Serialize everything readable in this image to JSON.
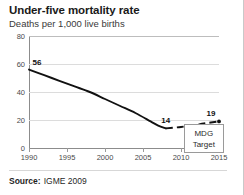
{
  "card": {
    "title": "Under-five mortality rate",
    "subtitle": "Deaths per 1,000 live births",
    "source_label": "Source:",
    "source_value": "IGME 2009"
  },
  "annotations": {
    "mdg_line1": "MDG",
    "mdg_line2": "Target"
  },
  "colors": {
    "line": "#111111",
    "grid": "#dcdcdc",
    "axis": "#8c8c8c",
    "text": "#1a1a1a",
    "card_bg": "#ffffff"
  },
  "chart_data": {
    "type": "line",
    "title": "Under-five mortality rate",
    "subtitle": "Deaths per 1,000 live births",
    "xlabel": "",
    "ylabel": "Deaths per 1,000 live births",
    "xlim": [
      1990,
      2015
    ],
    "ylim": [
      0,
      80
    ],
    "xticks": [
      1990,
      1995,
      2000,
      2005,
      2010,
      2015
    ],
    "xtick_labels": [
      "1990",
      "1995",
      "2000",
      "2005",
      "2010",
      "2015"
    ],
    "yticks": [
      0,
      20,
      40,
      60,
      80
    ],
    "ytick_labels": [
      "0",
      "20",
      "40",
      "60",
      "80"
    ],
    "grid": "horizontal",
    "legend": "none",
    "series": [
      {
        "name": "Observed under-five mortality rate",
        "style": "solid",
        "x": [
          1990,
          1992,
          1994,
          1996,
          1998,
          2000,
          2002,
          2004,
          2006,
          2007,
          2008
        ],
        "values": [
          56,
          52,
          48,
          44,
          40,
          35,
          30,
          25,
          19,
          16,
          14
        ]
      },
      {
        "name": "Projection to MDG target",
        "style": "dashed",
        "x": [
          2008,
          2010,
          2012,
          2013,
          2015
        ],
        "values": [
          14,
          15,
          16.5,
          17.5,
          19
        ]
      }
    ],
    "data_labels": [
      {
        "text": "56",
        "x": 1990,
        "y": 56
      },
      {
        "text": "14",
        "x": 2008,
        "y": 14
      },
      {
        "text": "19",
        "x": 2015,
        "y": 19
      }
    ],
    "annotations": [
      {
        "text": "MDG Target",
        "x": 2013,
        "y": 7,
        "type": "callout-box"
      }
    ]
  }
}
